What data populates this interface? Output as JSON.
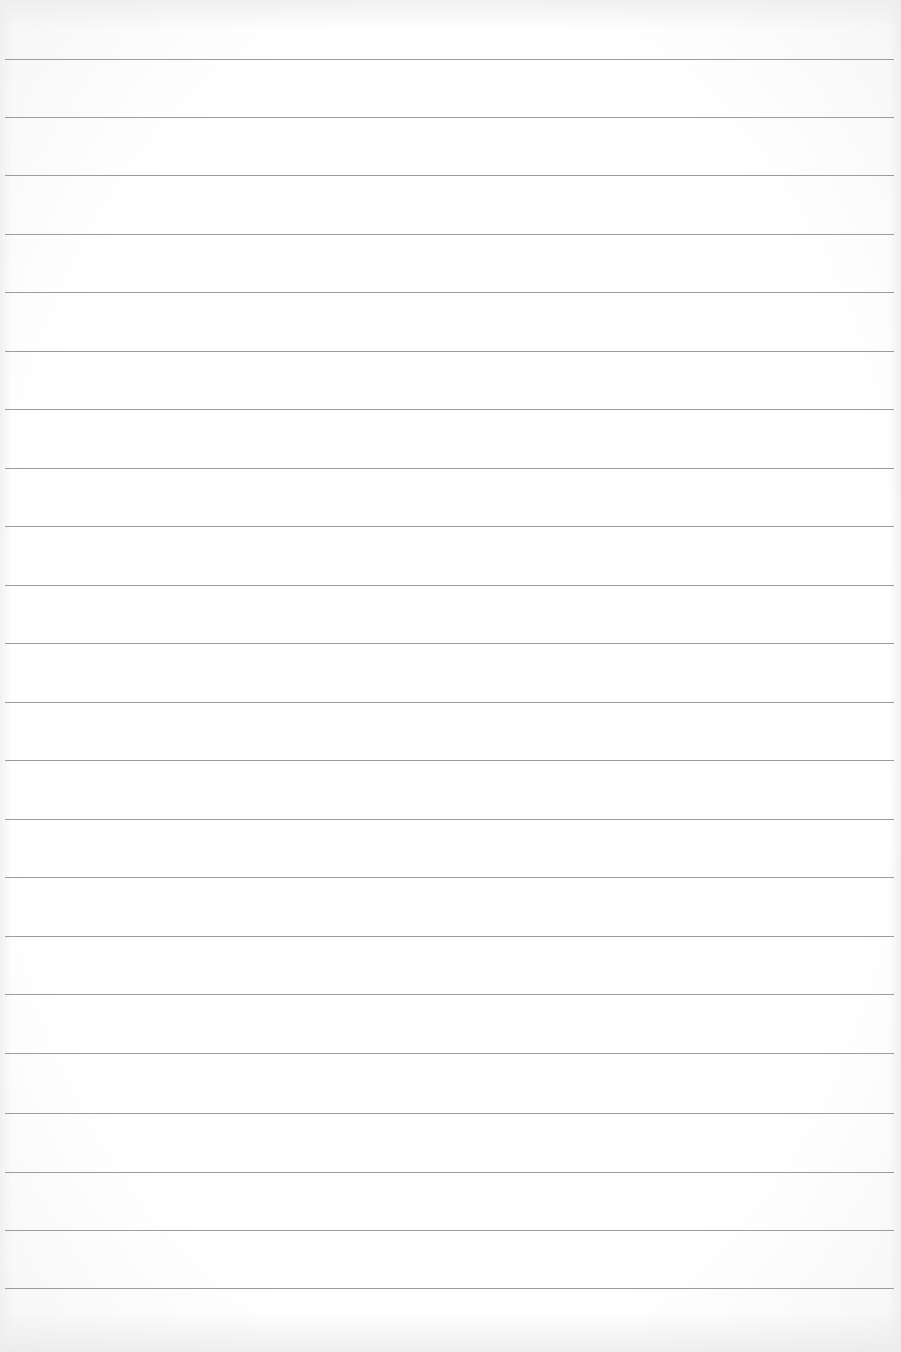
{
  "page": {
    "type": "blank lined paper",
    "background_color": "#ffffff",
    "rule_color": "#9c9c9c",
    "rule_count": 22,
    "rule_positions_y": [
      59,
      117,
      175,
      234,
      292,
      351,
      409,
      468,
      526,
      585,
      643,
      702,
      760,
      819,
      877,
      936,
      994,
      1053,
      1113,
      1172,
      1230,
      1288
    ],
    "rule_left_x": 5,
    "rule_right_x": 894
  }
}
